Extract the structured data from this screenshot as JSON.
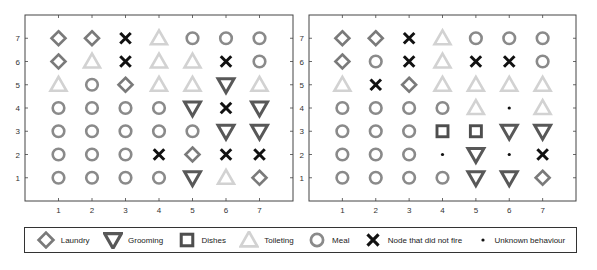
{
  "chart_data": [
    {
      "type": "scatter",
      "title": "",
      "xlabel": "",
      "ylabel": "",
      "xlim": [
        0,
        8
      ],
      "ylim": [
        0,
        8
      ],
      "xticks": [
        1,
        2,
        3,
        4,
        5,
        6,
        7
      ],
      "yticks": [
        1,
        2,
        3,
        4,
        5,
        6,
        7
      ],
      "grid": false,
      "description": "7x7 grid of sensor nodes; each cell marker shows the activity class assigned to the node",
      "rows_top_to_bottom": {
        "7": [
          "Laundry",
          "Laundry",
          "Node that did not fire",
          "Toileting",
          "Meal",
          "Meal",
          "Meal"
        ],
        "6": [
          "Laundry",
          "Toileting",
          "Node that did not fire",
          "Toileting",
          "Toileting",
          "Node that did not fire",
          "Meal"
        ],
        "5": [
          "Toileting",
          "Meal",
          "Laundry",
          "Toileting",
          "Toileting",
          "Grooming",
          "Toileting"
        ],
        "4": [
          "Meal",
          "Meal",
          "Meal",
          "Meal",
          "Grooming",
          "Node that did not fire",
          "Grooming"
        ],
        "3": [
          "Meal",
          "Meal",
          "Meal",
          "Meal",
          "Meal",
          "Grooming",
          "Grooming"
        ],
        "2": [
          "Meal",
          "Meal",
          "Meal",
          "Node that did not fire",
          "Laundry",
          "Node that did not fire",
          "Node that did not fire"
        ],
        "1": [
          "Meal",
          "Meal",
          "Meal",
          "Meal",
          "Grooming",
          "Toileting",
          "Laundry"
        ]
      }
    },
    {
      "type": "scatter",
      "title": "",
      "xlabel": "",
      "ylabel": "",
      "xlim": [
        0,
        8
      ],
      "ylim": [
        0,
        8
      ],
      "xticks": [
        1,
        2,
        3,
        4,
        5,
        6,
        7
      ],
      "yticks": [
        1,
        2,
        3,
        4,
        5,
        6,
        7
      ],
      "grid": false,
      "description": "7x7 grid of sensor nodes; each cell marker shows the activity class assigned to the node",
      "rows_top_to_bottom": {
        "7": [
          "Laundry",
          "Laundry",
          "Node that did not fire",
          "Toileting",
          "Meal",
          "Meal",
          "Meal"
        ],
        "6": [
          "Laundry",
          "Meal",
          "Node that did not fire",
          "Toileting",
          "Node that did not fire",
          "Node that did not fire",
          "Meal"
        ],
        "5": [
          "Toileting",
          "Node that did not fire",
          "Laundry",
          "Toileting",
          "Toileting",
          "Toileting",
          "Toileting"
        ],
        "4": [
          "Meal",
          "Meal",
          "Meal",
          "Meal",
          "Toileting",
          "Unknown behaviour",
          "Toileting"
        ],
        "3": [
          "Meal",
          "Meal",
          "Meal",
          "Dishes",
          "Dishes",
          "Grooming",
          "Grooming"
        ],
        "2": [
          "Meal",
          "Meal",
          "Meal",
          "Unknown behaviour",
          "Grooming",
          "Unknown behaviour",
          "Node that did not fire"
        ],
        "1": [
          "Meal",
          "Meal",
          "Meal",
          "Meal",
          "Grooming",
          "Grooming",
          "Laundry"
        ]
      }
    }
  ],
  "plots": [
    {
      "grid": [
        [
          "L",
          "L",
          "X",
          "T",
          "M",
          "M",
          "M"
        ],
        [
          "L",
          "T",
          "X",
          "T",
          "T",
          "X",
          "M"
        ],
        [
          "T",
          "M",
          "L",
          "T",
          "T",
          "G",
          "T"
        ],
        [
          "M",
          "M",
          "M",
          "M",
          "G",
          "X",
          "G"
        ],
        [
          "M",
          "M",
          "M",
          "M",
          "M",
          "G",
          "G"
        ],
        [
          "M",
          "M",
          "M",
          "X",
          "L",
          "X",
          "X"
        ],
        [
          "M",
          "M",
          "M",
          "M",
          "G",
          "T",
          "L"
        ]
      ]
    },
    {
      "grid": [
        [
          "L",
          "L",
          "X",
          "T",
          "M",
          "M",
          "M"
        ],
        [
          "L",
          "M",
          "X",
          "T",
          "X",
          "X",
          "M"
        ],
        [
          "T",
          "X",
          "L",
          "T",
          "T",
          "T",
          "T"
        ],
        [
          "M",
          "M",
          "M",
          "M",
          "T",
          "U",
          "T"
        ],
        [
          "M",
          "M",
          "M",
          "D",
          "D",
          "G",
          "G"
        ],
        [
          "M",
          "M",
          "M",
          "U",
          "G",
          "U",
          "X"
        ],
        [
          "M",
          "M",
          "M",
          "M",
          "G",
          "G",
          "L"
        ]
      ]
    }
  ],
  "ticks": {
    "x": [
      "1",
      "2",
      "3",
      "4",
      "5",
      "6",
      "7"
    ],
    "y": [
      "7",
      "6",
      "5",
      "4",
      "3",
      "2",
      "1"
    ]
  },
  "legend": {
    "items": [
      {
        "key": "L",
        "label": "Laundry",
        "icon": "diamond-icon"
      },
      {
        "key": "G",
        "label": "Grooming",
        "icon": "down-triangle-icon"
      },
      {
        "key": "D",
        "label": "Dishes",
        "icon": "square-icon"
      },
      {
        "key": "T",
        "label": "Toileting",
        "icon": "up-triangle-icon"
      },
      {
        "key": "M",
        "label": "Meal",
        "icon": "circle-icon"
      },
      {
        "key": "X",
        "label": "Node that did not fire",
        "icon": "x-cross-icon"
      },
      {
        "key": "U",
        "label": "Unknown behaviour",
        "icon": "dot-icon"
      }
    ]
  },
  "colors": {
    "L": "#7a7a7a",
    "G": "#585858",
    "D": "#4e4e4e",
    "T": "#d2d2d2",
    "M": "#8a8a8a",
    "X": "#111111",
    "U": "#111111",
    "axis": "#444444"
  }
}
